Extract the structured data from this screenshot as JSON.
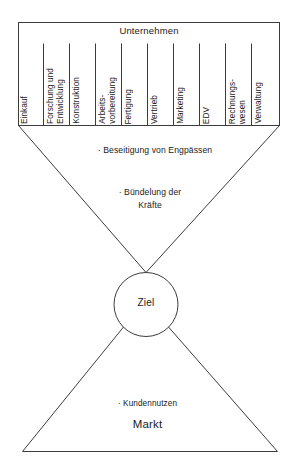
{
  "diagram": {
    "type": "funnel-diagram",
    "language": "de",
    "company": {
      "title": "Unternehmen",
      "departments": [
        {
          "label": "Einkauf"
        },
        {
          "label": "Forschung und\nEntwicklung"
        },
        {
          "label": "Konstruktion"
        },
        {
          "label": "Arbeits-\nvorbereitung"
        },
        {
          "label": "Fertigung"
        },
        {
          "label": "Vertrieb"
        },
        {
          "label": "Marketing"
        },
        {
          "label": "EDV"
        },
        {
          "label": "Rechnungs-\nwesen"
        },
        {
          "label": "Verwaltung"
        }
      ]
    },
    "funnel": {
      "benefit_1": "·  Beseitigung von Engpässen",
      "benefit_2": "·  Bündelung der\nKräfte"
    },
    "goal": {
      "label": "Ziel"
    },
    "market": {
      "bullet": "·  Kundennutzen",
      "label": "Markt"
    },
    "colors": {
      "stroke": "#3c3c3c",
      "text": "#1a1a1a",
      "background": "#ffffff"
    }
  }
}
